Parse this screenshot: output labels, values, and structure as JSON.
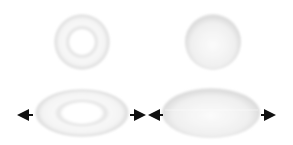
{
  "diagram": {
    "shapes": [
      {
        "id": "torus-rest",
        "type": "torus",
        "state": "rest",
        "cx": 82,
        "cy": 42,
        "rx": 28,
        "ry": 28,
        "hole_rx": 12,
        "hole_ry": 12
      },
      {
        "id": "sphere-rest",
        "type": "sphere",
        "state": "rest",
        "cx": 213,
        "cy": 42,
        "rx": 28,
        "ry": 28
      },
      {
        "id": "torus-stretched",
        "type": "torus",
        "state": "stretched",
        "cx": 82,
        "cy": 113,
        "rx": 47,
        "ry": 24,
        "hole_rx": 23,
        "hole_ry": 11
      },
      {
        "id": "sphere-stretched",
        "type": "sphere",
        "state": "stretched",
        "cx": 211,
        "cy": 113,
        "rx": 49,
        "ry": 25
      }
    ],
    "arrows": [
      {
        "id": "torus-left-arrow",
        "direction": "left",
        "x1": 33,
        "x2": 19,
        "y": 115
      },
      {
        "id": "torus-right-arrow",
        "direction": "right",
        "x1": 130,
        "x2": 145,
        "y": 115
      },
      {
        "id": "sphere-left-arrow",
        "direction": "left",
        "x1": 163,
        "x2": 150,
        "y": 115
      },
      {
        "id": "sphere-right-arrow",
        "direction": "right",
        "x1": 260,
        "x2": 275,
        "y": 115
      }
    ],
    "colors": {
      "background": "#ffffff",
      "shape_light": "#fafafa",
      "shape_shade": "#d8d8d8",
      "arrow": "#111111"
    }
  }
}
